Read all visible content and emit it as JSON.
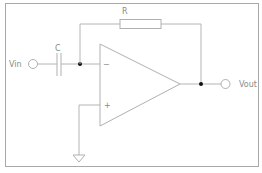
{
  "diagram": {
    "labels": {
      "input": "Vin",
      "output": "Vout",
      "capacitor": "C",
      "resistor": "R",
      "inverting": "−",
      "non_inverting": "+"
    },
    "components": [
      {
        "type": "terminal",
        "name": "Vin"
      },
      {
        "type": "capacitor",
        "name": "C"
      },
      {
        "type": "resistor",
        "name": "R"
      },
      {
        "type": "op-amp"
      },
      {
        "type": "ground"
      },
      {
        "type": "terminal",
        "name": "Vout"
      }
    ],
    "colors": {
      "wire": "#b4b4b4",
      "border": "#9a9a9a",
      "node": "#111111",
      "text": "#8a8a8a"
    }
  }
}
